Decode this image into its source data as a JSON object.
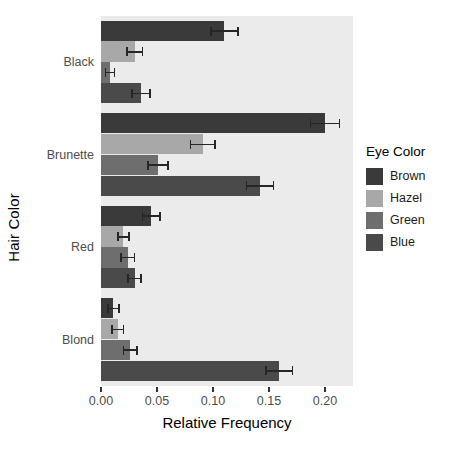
{
  "chart_data": {
    "type": "bar",
    "orientation": "horizontal",
    "title": "",
    "xlabel": "Relative Frequency",
    "ylabel": "Hair Color",
    "categories": [
      "Black",
      "Brunette",
      "Red",
      "Blond"
    ],
    "xlim": [
      0.0,
      0.225
    ],
    "xticks": [
      0.0,
      0.05,
      0.1,
      0.15,
      0.2
    ],
    "xticklabels": [
      "0.00",
      "0.05",
      "0.10",
      "0.15",
      "0.20"
    ],
    "grid": false,
    "panel_background": "#ebebeb",
    "legend": {
      "title": "Eye Color",
      "position": "right",
      "entries": [
        {
          "name": "Brown",
          "color": "#3a3a3a"
        },
        {
          "name": "Hazel",
          "color": "#a8a8a8"
        },
        {
          "name": "Green",
          "color": "#6e6e6e"
        },
        {
          "name": "Blue",
          "color": "#4a4a4a"
        }
      ]
    },
    "series": [
      {
        "name": "Brown",
        "color": "#3a3a3a",
        "values": [
          0.11,
          0.2,
          0.045,
          0.011
        ],
        "errors": [
          0.012,
          0.013,
          0.008,
          0.005
        ]
      },
      {
        "name": "Hazel",
        "color": "#a8a8a8",
        "values": [
          0.03,
          0.091,
          0.02,
          0.015
        ],
        "errors": [
          0.007,
          0.011,
          0.005,
          0.005
        ]
      },
      {
        "name": "Green",
        "color": "#6e6e6e",
        "values": [
          0.008,
          0.051,
          0.024,
          0.026
        ],
        "errors": [
          0.004,
          0.009,
          0.006,
          0.006
        ]
      },
      {
        "name": "Blue",
        "color": "#4a4a4a",
        "values": [
          0.036,
          0.142,
          0.03,
          0.159
        ],
        "errors": [
          0.008,
          0.012,
          0.006,
          0.012
        ]
      }
    ]
  }
}
